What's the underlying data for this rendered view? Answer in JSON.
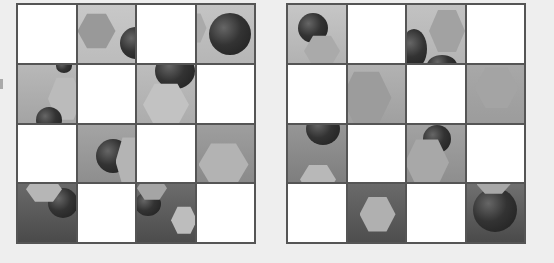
{
  "layout": {
    "rows": 4,
    "cols": 4
  },
  "colors": {
    "border": "#555555",
    "background": "#eeeeee",
    "blank": "#ffffff"
  },
  "grids": [
    {
      "name": "left",
      "cells": [
        {
          "row": 0,
          "col": 0,
          "type": "blank"
        },
        {
          "row": 0,
          "col": 1,
          "type": "scene",
          "top": "#c8c8c8",
          "bottom": "#bcbcbc",
          "shapes": [
            {
              "kind": "hex",
              "x": 0,
              "y": 8,
              "w": 38,
              "h": 36,
              "color": "#999"
            },
            {
              "kind": "sphere",
              "x": 42,
              "y": 22,
              "w": 32,
              "h": 32
            }
          ]
        },
        {
          "row": 0,
          "col": 2,
          "type": "blank"
        },
        {
          "row": 0,
          "col": 3,
          "type": "scene",
          "top": "#c4c4c4",
          "bottom": "#b6b6b6",
          "shapes": [
            {
              "kind": "hex",
              "x": -14,
              "y": 8,
              "w": 24,
              "h": 30,
              "color": "#aaa"
            },
            {
              "kind": "sphere",
              "x": 12,
              "y": 8,
              "w": 42,
              "h": 42
            }
          ]
        },
        {
          "row": 1,
          "col": 0,
          "type": "scene",
          "top": "#b8b8b8",
          "bottom": "#a4a4a4",
          "shapes": [
            {
              "kind": "hex",
              "x": 30,
              "y": 12,
              "w": 34,
              "h": 44,
              "color": "#bbb"
            },
            {
              "kind": "sphere",
              "x": 38,
              "y": -6,
              "w": 16,
              "h": 14
            },
            {
              "kind": "sphere",
              "x": 18,
              "y": 42,
              "w": 26,
              "h": 26
            }
          ]
        },
        {
          "row": 1,
          "col": 1,
          "type": "blank"
        },
        {
          "row": 1,
          "col": 2,
          "type": "scene",
          "top": "#bdbdbd",
          "bottom": "#acacac",
          "shapes": [
            {
              "kind": "sphere",
              "x": 18,
              "y": -12,
              "w": 40,
              "h": 36
            },
            {
              "kind": "hex",
              "x": 6,
              "y": 18,
              "w": 46,
              "h": 44,
              "color": "#c2c2c2"
            }
          ]
        },
        {
          "row": 1,
          "col": 3,
          "type": "blank"
        },
        {
          "row": 2,
          "col": 0,
          "type": "blank"
        },
        {
          "row": 2,
          "col": 1,
          "type": "scene",
          "top": "#a4a4a4",
          "bottom": "#8e8e8e",
          "shapes": [
            {
              "kind": "sphere",
              "x": 18,
              "y": 14,
              "w": 34,
              "h": 34
            },
            {
              "kind": "hex",
              "x": 38,
              "y": 12,
              "w": 28,
              "h": 50,
              "color": "#b4b4b4"
            }
          ]
        },
        {
          "row": 2,
          "col": 2,
          "type": "blank"
        },
        {
          "row": 2,
          "col": 3,
          "type": "scene",
          "top": "#9e9e9e",
          "bottom": "#8a8a8a",
          "shapes": [
            {
              "kind": "hex",
              "x": 2,
              "y": 18,
              "w": 50,
              "h": 44,
              "color": "#b3b3b3"
            }
          ]
        },
        {
          "row": 3,
          "col": 0,
          "type": "scene",
          "top": "#6a6a6a",
          "bottom": "#4a4a4a",
          "shapes": [
            {
              "kind": "sphere",
              "x": 30,
              "y": 4,
              "w": 30,
              "h": 30
            },
            {
              "kind": "hex",
              "x": 8,
              "y": -8,
              "w": 36,
              "h": 26,
              "color": "#b6b6b6"
            }
          ]
        },
        {
          "row": 3,
          "col": 1,
          "type": "blank"
        },
        {
          "row": 3,
          "col": 2,
          "type": "scene",
          "top": "#6c6c6c",
          "bottom": "#4c4c4c",
          "shapes": [
            {
              "kind": "sphere",
              "x": -2,
              "y": 8,
              "w": 26,
              "h": 24
            },
            {
              "kind": "hex",
              "x": 0,
              "y": -8,
              "w": 30,
              "h": 24,
              "color": "#a5a5a5"
            },
            {
              "kind": "hex",
              "x": 34,
              "y": 22,
              "w": 26,
              "h": 28,
              "color": "#bdbdbd"
            }
          ]
        },
        {
          "row": 3,
          "col": 3,
          "type": "blank"
        }
      ]
    },
    {
      "name": "right",
      "cells": [
        {
          "row": 0,
          "col": 0,
          "type": "scene",
          "top": "#c6c6c6",
          "bottom": "#b2b2b2",
          "shapes": [
            {
              "kind": "sphere",
              "x": 10,
              "y": 8,
              "w": 30,
              "h": 30
            },
            {
              "kind": "hex",
              "x": 16,
              "y": 30,
              "w": 36,
              "h": 32,
              "color": "#aaa"
            }
          ]
        },
        {
          "row": 0,
          "col": 1,
          "type": "blank"
        },
        {
          "row": 0,
          "col": 2,
          "type": "scene",
          "top": "#c2c2c2",
          "bottom": "#b4b4b4",
          "shapes": [
            {
              "kind": "hex",
              "x": 22,
              "y": 4,
              "w": 36,
              "h": 44,
              "color": "#a2a2a2"
            },
            {
              "kind": "sphere",
              "x": -6,
              "y": 24,
              "w": 26,
              "h": 40
            },
            {
              "kind": "sphere",
              "x": 20,
              "y": 50,
              "w": 30,
              "h": 20
            }
          ]
        },
        {
          "row": 0,
          "col": 3,
          "type": "blank"
        },
        {
          "row": 1,
          "col": 0,
          "type": "blank"
        },
        {
          "row": 1,
          "col": 1,
          "type": "scene",
          "top": "#b2b2b2",
          "bottom": "#a0a0a0",
          "shapes": [
            {
              "kind": "hex",
              "x": -6,
              "y": 6,
              "w": 50,
              "h": 54,
              "color": "#9c9c9c"
            }
          ]
        },
        {
          "row": 1,
          "col": 2,
          "type": "blank"
        },
        {
          "row": 1,
          "col": 3,
          "type": "scene",
          "top": "#a8a8a8",
          "bottom": "#9c9c9c",
          "shapes": [
            {
              "kind": "hex",
              "x": 8,
              "y": 2,
              "w": 44,
              "h": 42,
              "color": "#a4a4a4"
            }
          ]
        },
        {
          "row": 2,
          "col": 0,
          "type": "scene",
          "top": "#969696",
          "bottom": "#7e7e7e",
          "shapes": [
            {
              "kind": "sphere",
              "x": 18,
              "y": -12,
              "w": 34,
              "h": 32
            },
            {
              "kind": "hex",
              "x": 12,
              "y": 40,
              "w": 36,
              "h": 30,
              "color": "#b8b8b8"
            }
          ]
        },
        {
          "row": 2,
          "col": 1,
          "type": "blank"
        },
        {
          "row": 2,
          "col": 2,
          "type": "scene",
          "top": "#a2a2a2",
          "bottom": "#8e8e8e",
          "shapes": [
            {
              "kind": "sphere",
              "x": 16,
              "y": 0,
              "w": 28,
              "h": 28
            },
            {
              "kind": "hex",
              "x": -2,
              "y": 14,
              "w": 44,
              "h": 48,
              "color": "#a8a8a8"
            }
          ]
        },
        {
          "row": 2,
          "col": 3,
          "type": "blank"
        },
        {
          "row": 3,
          "col": 0,
          "type": "blank"
        },
        {
          "row": 3,
          "col": 1,
          "type": "scene",
          "top": "#6a6a6a",
          "bottom": "#4e4e4e",
          "shapes": [
            {
              "kind": "hex",
              "x": 12,
              "y": 12,
              "w": 36,
              "h": 36,
              "color": "#b0b0b0"
            }
          ]
        },
        {
          "row": 3,
          "col": 2,
          "type": "blank"
        },
        {
          "row": 3,
          "col": 3,
          "type": "scene",
          "top": "#707070",
          "bottom": "#4a4a4a",
          "shapes": [
            {
              "kind": "sphere",
              "x": 6,
              "y": 4,
              "w": 44,
              "h": 44
            },
            {
              "kind": "hex",
              "x": 10,
              "y": -10,
              "w": 34,
              "h": 20,
              "color": "#a8a8a8"
            }
          ]
        }
      ]
    }
  ]
}
